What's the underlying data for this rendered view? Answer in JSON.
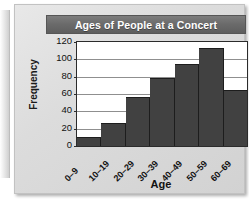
{
  "chart_data": {
    "type": "bar",
    "title": "Ages of People at a Concert",
    "xlabel": "Age",
    "ylabel": "Frequency",
    "categories": [
      "0–9",
      "10–19",
      "20–29",
      "30–39",
      "40–49",
      "50–59",
      "60–69"
    ],
    "values": [
      10,
      27,
      57,
      78,
      95,
      113,
      65
    ],
    "ylim": [
      0,
      120
    ],
    "yticks": [
      0,
      20,
      40,
      60,
      80,
      100,
      120
    ],
    "grid": "horizontal",
    "legend": "none",
    "colors": {
      "bar": "#414141",
      "plot_background": "#ffffff",
      "title_banner": "#6a6a6a",
      "title_text": "#ffffff",
      "page_background": "#dcdcdc",
      "axis": "#2b2b2b",
      "gridline": "#8f8f8f"
    }
  }
}
